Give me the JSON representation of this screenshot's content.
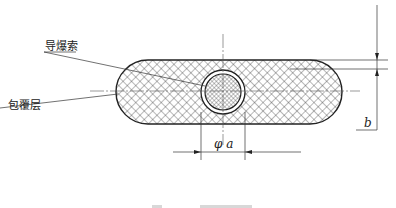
{
  "figure": {
    "labels": {
      "detonating_cord": "导爆索",
      "coating_layer": "包覆层"
    },
    "dimensions": {
      "diameter": "φ a",
      "thickness": "b"
    },
    "caption_partial": "图 ··· 外形尺寸"
  },
  "colors": {
    "line": "#222222",
    "centerline": "#555555",
    "background": "#ffffff"
  }
}
